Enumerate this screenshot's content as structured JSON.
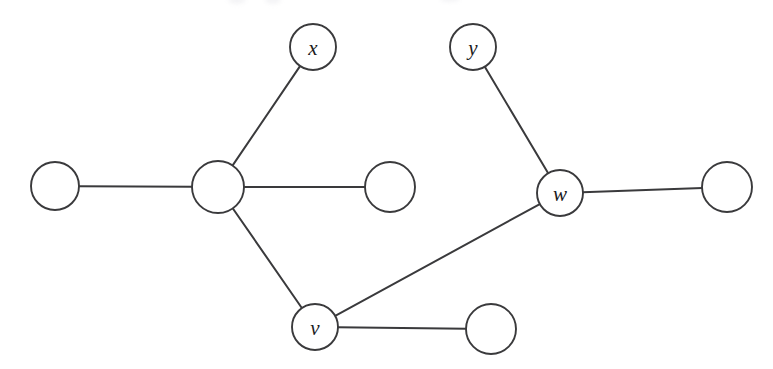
{
  "diagram": {
    "type": "node-link-graph",
    "background_color": "#ffffff",
    "stroke_color": "#3a3a3c",
    "node_fill_color": "#ffffff",
    "label_color": "#1b1b1d",
    "canvas": {
      "width": 773,
      "height": 369
    },
    "node_count": 9,
    "edge_count": 8,
    "nodes": [
      {
        "id": "n1",
        "label": "",
        "cx": 55,
        "cy": 186,
        "r": 24
      },
      {
        "id": "n2",
        "label": "",
        "cx": 218,
        "cy": 187,
        "r": 26
      },
      {
        "id": "x",
        "label": "x",
        "cx": 313,
        "cy": 47,
        "r": 23
      },
      {
        "id": "n4",
        "label": "",
        "cx": 390,
        "cy": 187,
        "r": 25
      },
      {
        "id": "v",
        "label": "v",
        "cx": 315,
        "cy": 327,
        "r": 23
      },
      {
        "id": "n6",
        "label": "",
        "cx": 491,
        "cy": 329,
        "r": 25
      },
      {
        "id": "y",
        "label": "y",
        "cx": 473,
        "cy": 47,
        "r": 23
      },
      {
        "id": "w",
        "label": "w",
        "cx": 560,
        "cy": 193,
        "r": 23
      },
      {
        "id": "n9",
        "label": "",
        "cx": 727,
        "cy": 187,
        "r": 25
      }
    ],
    "edges": [
      {
        "id": "e1",
        "from": "n1",
        "to": "n2"
      },
      {
        "id": "e2",
        "from": "n2",
        "to": "x"
      },
      {
        "id": "e3",
        "from": "n2",
        "to": "n4"
      },
      {
        "id": "e4",
        "from": "n2",
        "to": "v"
      },
      {
        "id": "e5",
        "from": "v",
        "to": "w"
      },
      {
        "id": "e6",
        "from": "v",
        "to": "n6"
      },
      {
        "id": "e7",
        "from": "y",
        "to": "w"
      },
      {
        "id": "e8",
        "from": "w",
        "to": "n9"
      }
    ]
  }
}
